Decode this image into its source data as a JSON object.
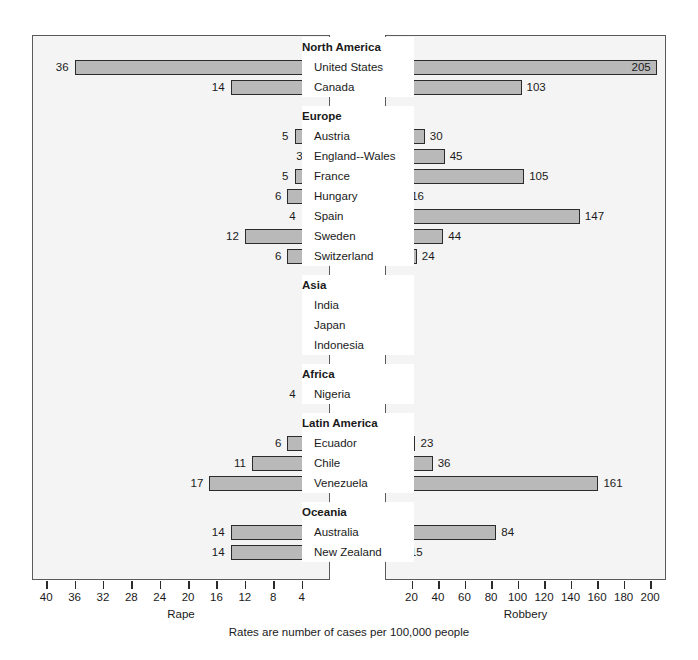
{
  "chart_data": {
    "type": "bar",
    "title": "",
    "subtitle": "",
    "caption": "Rates are number of cases per 100,000 people",
    "orientation": "horizontal",
    "layout": "paired back-to-back panels with shared center category labels",
    "grid": false,
    "legend": null,
    "panels": [
      {
        "name": "left",
        "xlabel": "Rape",
        "direction": "right-to-left",
        "xlim": [
          0,
          42
        ],
        "ticks": [
          40,
          36,
          32,
          28,
          24,
          20,
          16,
          12,
          8,
          4
        ],
        "tick_labels": [
          "40",
          "36",
          "32",
          "28",
          "24",
          "20",
          "16",
          "12",
          "8",
          "4"
        ]
      },
      {
        "name": "right",
        "xlabel": "Robbery",
        "direction": "left-to-right",
        "xlim": [
          0,
          212
        ],
        "ticks": [
          20,
          40,
          60,
          80,
          100,
          120,
          140,
          160,
          180,
          200
        ],
        "tick_labels": [
          "20",
          "40",
          "60",
          "80",
          "100",
          "120",
          "140",
          "160",
          "180",
          "200"
        ]
      }
    ],
    "groups": [
      {
        "group": "North America",
        "categories": [
          "United States",
          "Canada"
        ],
        "series": [
          {
            "name": "Rape",
            "values": [
              36,
              14
            ]
          },
          {
            "name": "Robbery",
            "values": [
              205,
              103
            ]
          }
        ]
      },
      {
        "group": "Europe",
        "categories": [
          "Austria",
          "England--Wales",
          "France",
          "Hungary",
          "Spain",
          "Sweden",
          "Switzerland"
        ],
        "series": [
          {
            "name": "Rape",
            "values": [
              5,
              3,
              5,
              6,
              4,
              12,
              6
            ]
          },
          {
            "name": "Robbery",
            "values": [
              30,
              45,
              105,
              16,
              147,
              44,
              24
            ]
          }
        ]
      },
      {
        "group": "Asia",
        "categories": [
          "India",
          "Japan",
          "Indonesia"
        ],
        "series": [
          {
            "name": "Rape",
            "values": [
              1,
              2,
              1
            ]
          },
          {
            "name": "Robbery",
            "values": [
              4,
              2,
              6
            ]
          }
        ]
      },
      {
        "group": "Africa",
        "categories": [
          "Nigeria"
        ],
        "series": [
          {
            "name": "Rape",
            "values": [
              4
            ]
          },
          {
            "name": "Robbery",
            "values": [
              4
            ]
          }
        ]
      },
      {
        "group": "Latin America",
        "categories": [
          "Ecuador",
          "Chile",
          "Venezuela"
        ],
        "series": [
          {
            "name": "Rape",
            "values": [
              6,
              11,
              17
            ]
          },
          {
            "name": "Robbery",
            "values": [
              23,
              36,
              161
            ]
          }
        ]
      },
      {
        "group": "Oceania",
        "categories": [
          "Australia",
          "New Zealand"
        ],
        "series": [
          {
            "name": "Rape",
            "values": [
              14,
              14
            ]
          },
          {
            "name": "Robbery",
            "values": [
              84,
              15
            ]
          }
        ]
      }
    ]
  },
  "colors": {
    "bar_fill": "#b9b9b9",
    "bar_border": "#2b2b2b",
    "panel_background": "#f4f4f4",
    "panel_border": "#5a5a5a",
    "page_background": "#ffffff",
    "text": "#1a1a1a"
  }
}
